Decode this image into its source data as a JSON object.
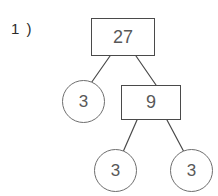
{
  "worksheet": {
    "problem_label": "1 )",
    "stroke_color": "#4a4a4a",
    "text_color": "#585858",
    "background_color": "#ffffff"
  },
  "diagram": {
    "type": "factor-tree",
    "nodes": {
      "root": {
        "value": "27",
        "shape": "rectangle",
        "role": "composite"
      },
      "leaf_a": {
        "value": "3",
        "shape": "circle",
        "role": "prime"
      },
      "mid": {
        "value": "9",
        "shape": "rectangle",
        "role": "composite"
      },
      "leaf_b": {
        "value": "3",
        "shape": "circle",
        "role": "prime"
      },
      "leaf_c": {
        "value": "3",
        "shape": "circle",
        "role": "prime"
      }
    },
    "edges": [
      {
        "from": "root",
        "to": "leaf_a"
      },
      {
        "from": "root",
        "to": "mid"
      },
      {
        "from": "mid",
        "to": "leaf_b"
      },
      {
        "from": "mid",
        "to": "leaf_c"
      }
    ]
  }
}
